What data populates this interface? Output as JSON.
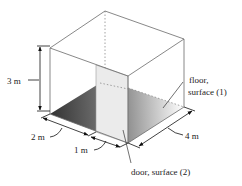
{
  "figure": {
    "colors": {
      "edge": "#6a6a6a",
      "dim_line": "#111111",
      "floor_dark": "#3a3a3a",
      "floor_light": "#ffffff",
      "door_fill": "#ebebeb",
      "door_edge": "#9a9a9a"
    },
    "dimensions": {
      "height": "3 m",
      "left_segment": "2 m",
      "door_width": "1 m",
      "depth": "4 m"
    },
    "labels": {
      "floor_line1": "floor,",
      "floor_line2": "surface (1)",
      "door": "door, surface (2)"
    }
  }
}
